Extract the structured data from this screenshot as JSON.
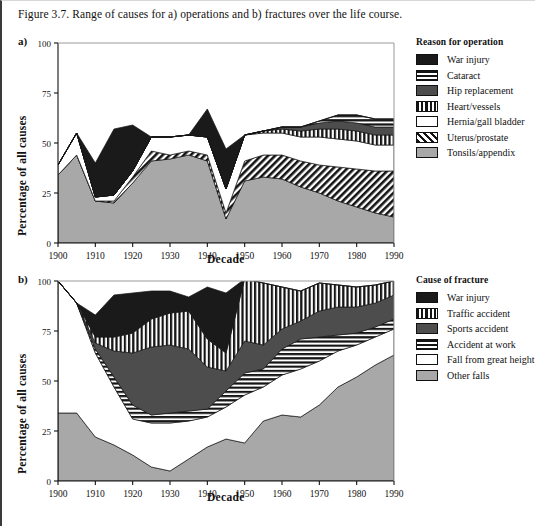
{
  "caption": "Figure 3.7. Range of causes for a) operations and b) fractures over the life course.",
  "panel_a": {
    "letter": "a)",
    "ylabel": "Percentage of all causes",
    "xlabel": "Decade",
    "legend_title": "Reason for operation"
  },
  "panel_b": {
    "letter": "b)",
    "ylabel": "Percentage of all causes",
    "xlabel": "Decade",
    "legend_title": "Cause of fracture"
  },
  "colors": {
    "war_injury": "#1a1a1a",
    "dark_grey": "#4d4d4d",
    "light_grey": "#a8a8a8",
    "white": "#ffffff",
    "axis": "#111111"
  },
  "chart_data": [
    {
      "type": "area",
      "id": "panel-a",
      "title": "a) Range of causes for operations over the life course",
      "xlabel": "Decade",
      "ylabel": "Percentage of all causes",
      "xlim": [
        1900,
        1990
      ],
      "ylim": [
        0,
        100
      ],
      "yticks": [
        0,
        25,
        50,
        75,
        100
      ],
      "xticks": [
        1900,
        1910,
        1920,
        1930,
        1940,
        1950,
        1960,
        1970,
        1980,
        1990
      ],
      "grid": false,
      "legend_position": "right",
      "stacking": "bottom-to-top",
      "x": [
        1900,
        1905,
        1910,
        1915,
        1920,
        1925,
        1930,
        1935,
        1940,
        1945,
        1950,
        1955,
        1960,
        1965,
        1970,
        1975,
        1980,
        1985,
        1990
      ],
      "series": [
        {
          "name": "Tonsils/appendix",
          "pattern": "solid-light-grey",
          "color": "#a8a8a8",
          "values": [
            34,
            44,
            21,
            20,
            30,
            41,
            42,
            44,
            41,
            12,
            31,
            33,
            32,
            28,
            25,
            21,
            18,
            15,
            13
          ]
        },
        {
          "name": "Uterus/prostate",
          "pattern": "diagonal-hatch",
          "color": "#1a1a1a",
          "values": [
            0,
            0,
            0,
            1,
            3,
            5,
            2,
            2,
            3,
            3,
            10,
            11,
            12,
            13,
            14,
            17,
            19,
            21,
            23
          ]
        },
        {
          "name": "Hernia/gall bladder",
          "pattern": "white",
          "color": "#ffffff",
          "values": [
            5,
            11,
            2,
            3,
            3,
            7,
            9,
            8,
            9,
            12,
            13,
            11,
            11,
            12,
            14,
            14,
            14,
            13,
            13
          ]
        },
        {
          "name": "Heart/vessels",
          "pattern": "vertical-hatch",
          "color": "#1a1a1a",
          "values": [
            0,
            0,
            0,
            0,
            0,
            0,
            0,
            0,
            0,
            0,
            0,
            1,
            2,
            3,
            4,
            5,
            5,
            5,
            5
          ]
        },
        {
          "name": "Hip replacement",
          "pattern": "solid-dark-grey",
          "color": "#4d4d4d",
          "values": [
            0,
            0,
            0,
            0,
            0,
            0,
            0,
            0,
            0,
            0,
            0,
            0,
            1,
            2,
            3,
            4,
            4,
            4,
            4
          ]
        },
        {
          "name": "Cataract",
          "pattern": "horizontal-hatch",
          "color": "#1a1a1a",
          "values": [
            0,
            0,
            0,
            0,
            0,
            0,
            0,
            0,
            0,
            0,
            0,
            0,
            0,
            0,
            1,
            3,
            4,
            4,
            4
          ]
        },
        {
          "name": "War injury",
          "pattern": "solid-black",
          "color": "#1a1a1a",
          "values": [
            0,
            0,
            17,
            33,
            23,
            0,
            0,
            0,
            14,
            20,
            0,
            0,
            0,
            0,
            0,
            0,
            0,
            0,
            0
          ]
        }
      ],
      "legend_entries": [
        {
          "label": "War injury",
          "pattern": "solid-black"
        },
        {
          "label": "Cataract",
          "pattern": "horizontal-hatch"
        },
        {
          "label": "Hip replacement",
          "pattern": "solid-dark-grey"
        },
        {
          "label": "Heart/vessels",
          "pattern": "vertical-hatch"
        },
        {
          "label": "Hernia/gall bladder",
          "pattern": "white"
        },
        {
          "label": "Uterus/prostate",
          "pattern": "diagonal-hatch"
        },
        {
          "label": "Tonsils/appendix",
          "pattern": "solid-light-grey"
        }
      ]
    },
    {
      "type": "area",
      "id": "panel-b",
      "title": "b) Range of causes for fractures over the life course",
      "xlabel": "Decade",
      "ylabel": "Percentage of all causes",
      "xlim": [
        1900,
        1990
      ],
      "ylim": [
        0,
        100
      ],
      "yticks": [
        0,
        25,
        50,
        75,
        100
      ],
      "xticks": [
        1900,
        1910,
        1920,
        1930,
        1940,
        1950,
        1960,
        1970,
        1980,
        1990
      ],
      "grid": false,
      "legend_position": "right",
      "stacking": "bottom-to-top",
      "x": [
        1900,
        1905,
        1910,
        1915,
        1920,
        1925,
        1930,
        1935,
        1940,
        1945,
        1950,
        1955,
        1960,
        1965,
        1970,
        1975,
        1980,
        1985,
        1990
      ],
      "series": [
        {
          "name": "Other falls",
          "pattern": "solid-light-grey",
          "color": "#a8a8a8",
          "values": [
            34,
            34,
            22,
            18,
            13,
            7,
            5,
            11,
            17,
            21,
            19,
            30,
            33,
            32,
            38,
            47,
            52,
            58,
            63
          ]
        },
        {
          "name": "Fall from great height",
          "pattern": "white",
          "color": "#ffffff",
          "values": [
            66,
            55,
            42,
            29,
            18,
            22,
            24,
            19,
            15,
            16,
            24,
            17,
            20,
            24,
            22,
            18,
            16,
            14,
            13
          ]
        },
        {
          "name": "Accident at work",
          "pattern": "horizontal-hatch",
          "color": "#1a1a1a",
          "values": [
            0,
            0,
            2,
            5,
            7,
            4,
            5,
            5,
            4,
            8,
            11,
            9,
            13,
            15,
            12,
            8,
            6,
            5,
            5
          ]
        },
        {
          "name": "Sports accident",
          "pattern": "solid-dark-grey",
          "color": "#4d4d4d",
          "values": [
            0,
            0,
            3,
            13,
            26,
            34,
            34,
            31,
            21,
            10,
            16,
            12,
            10,
            9,
            13,
            14,
            13,
            12,
            12
          ]
        },
        {
          "name": "Traffic accident",
          "pattern": "vertical-hatch",
          "color": "#1a1a1a",
          "values": [
            0,
            0,
            3,
            7,
            10,
            14,
            16,
            19,
            14,
            9,
            31,
            31,
            21,
            15,
            14,
            11,
            10,
            9,
            7
          ]
        },
        {
          "name": "War injury",
          "pattern": "solid-black",
          "color": "#1a1a1a",
          "values": [
            0,
            0,
            11,
            21,
            20,
            14,
            11,
            7,
            26,
            30,
            0,
            0,
            0,
            0,
            0,
            0,
            0,
            0,
            0
          ]
        }
      ],
      "legend_entries": [
        {
          "label": "War injury",
          "pattern": "solid-black"
        },
        {
          "label": "Traffic accident",
          "pattern": "vertical-hatch"
        },
        {
          "label": "Sports accident",
          "pattern": "solid-dark-grey"
        },
        {
          "label": "Accident at work",
          "pattern": "horizontal-hatch"
        },
        {
          "label": "Fall from great height",
          "pattern": "white"
        },
        {
          "label": "Other falls",
          "pattern": "solid-light-grey"
        }
      ]
    }
  ]
}
